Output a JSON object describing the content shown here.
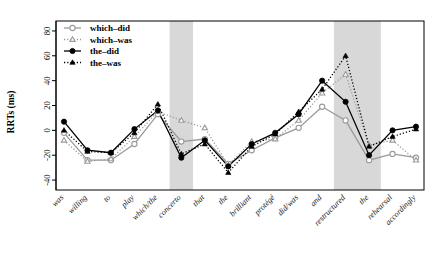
{
  "chart_data": {
    "type": "line",
    "title": "",
    "xlabel": "",
    "ylabel": "RRTs (ms)",
    "ylim": [
      -48,
      88
    ],
    "yticks": [
      -40,
      -20,
      0,
      20,
      40,
      60,
      80
    ],
    "grid": false,
    "legend_position": "top-left",
    "categories": [
      "was",
      "willing",
      "to",
      "play",
      "which/the",
      "concerto",
      "that",
      "the",
      "brilliant",
      "protégé",
      "did/was",
      "and",
      "restructured",
      "the",
      "rehearsal",
      "accordingly"
    ],
    "series": [
      {
        "name": "which–did",
        "marker": "open-circle",
        "line": "solid",
        "color": "#9a9a9a",
        "values": [
          -2,
          -24,
          -24,
          -11,
          13,
          -9,
          -7,
          -27,
          -16,
          -6,
          2,
          19,
          8,
          -24,
          -19,
          -22
        ]
      },
      {
        "name": "which–was",
        "marker": "open-triangle",
        "line": "dotted",
        "color": "#9a9a9a",
        "values": [
          -8,
          -25,
          -23,
          -5,
          15,
          8,
          2,
          -28,
          -9,
          -7,
          8,
          30,
          45,
          -12,
          -8,
          -24
        ]
      },
      {
        "name": "the–did",
        "marker": "filled-circle",
        "line": "solid",
        "color": "#000000",
        "values": [
          7,
          -16,
          -18,
          1,
          16,
          -22,
          -8,
          -29,
          -11,
          -2,
          13,
          40,
          23,
          -20,
          0,
          3
        ]
      },
      {
        "name": "the–was",
        "marker": "filled-triangle",
        "line": "dotted",
        "color": "#000000",
        "values": [
          0,
          -17,
          -18,
          -2,
          21,
          -19,
          -11,
          -34,
          -13,
          -3,
          15,
          33,
          60,
          -13,
          -5,
          1
        ]
      }
    ],
    "shaded_bands": [
      {
        "from_index": 5,
        "to_index": 5,
        "color": "#d8d8d8"
      },
      {
        "from_index": 12,
        "to_index": 13,
        "color": "#d8d8d8"
      }
    ]
  },
  "legend": {
    "entries": [
      {
        "label": "which–did"
      },
      {
        "label": "which–was"
      },
      {
        "label": "the–did"
      },
      {
        "label": "the–was"
      }
    ]
  }
}
